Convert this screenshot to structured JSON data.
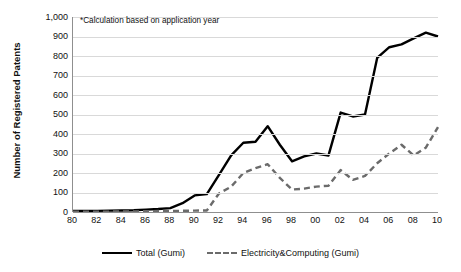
{
  "chart_data": {
    "type": "line",
    "title": "",
    "xlabel": "",
    "ylabel": "Number of Registered Patents",
    "annotation": "*Calculation based on application year",
    "grid": true,
    "legend_position": "bottom",
    "ylim": [
      0,
      1000
    ],
    "yticks": [
      0,
      100,
      200,
      300,
      400,
      500,
      600,
      700,
      800,
      900,
      1000
    ],
    "ytick_labels": [
      "0",
      "100",
      "200",
      "300",
      "400",
      "500",
      "600",
      "700",
      "800",
      "900",
      "1,000"
    ],
    "x": [
      1980,
      1981,
      1982,
      1983,
      1984,
      1985,
      1986,
      1987,
      1988,
      1989,
      1990,
      1991,
      1992,
      1993,
      1994,
      1995,
      1996,
      1997,
      1998,
      1999,
      2000,
      2001,
      2002,
      2003,
      2004,
      2005,
      2006,
      2007,
      2008,
      2009,
      2010
    ],
    "xtick_labels": [
      "80",
      "82",
      "84",
      "86",
      "88",
      "90",
      "92",
      "94",
      "96",
      "98",
      "00",
      "02",
      "04",
      "06",
      "08",
      "10"
    ],
    "xtick_values": [
      1980,
      1982,
      1984,
      1986,
      1988,
      1990,
      1992,
      1994,
      1996,
      1998,
      2000,
      2002,
      2004,
      2006,
      2008,
      2010
    ],
    "series": [
      {
        "name": "Total (Gumi)",
        "style": "solid",
        "color": "#000000",
        "values": [
          5,
          5,
          6,
          7,
          8,
          9,
          12,
          15,
          20,
          45,
          85,
          92,
          190,
          290,
          355,
          360,
          440,
          345,
          260,
          285,
          300,
          290,
          510,
          490,
          500,
          790,
          845,
          860,
          890,
          920,
          900
        ]
      },
      {
        "name": "Electricity&Computing (Gumi)",
        "style": "dashed",
        "color": "#6b6b6b",
        "values": [
          2,
          2,
          2,
          2,
          3,
          3,
          4,
          5,
          6,
          6,
          7,
          8,
          95,
          130,
          200,
          225,
          245,
          175,
          115,
          120,
          130,
          135,
          215,
          165,
          185,
          250,
          300,
          345,
          290,
          330,
          435
        ]
      }
    ]
  },
  "legend": {
    "items": [
      {
        "label": "Total (Gumi)"
      },
      {
        "label": "Electricity&Computing (Gumi)"
      }
    ]
  }
}
